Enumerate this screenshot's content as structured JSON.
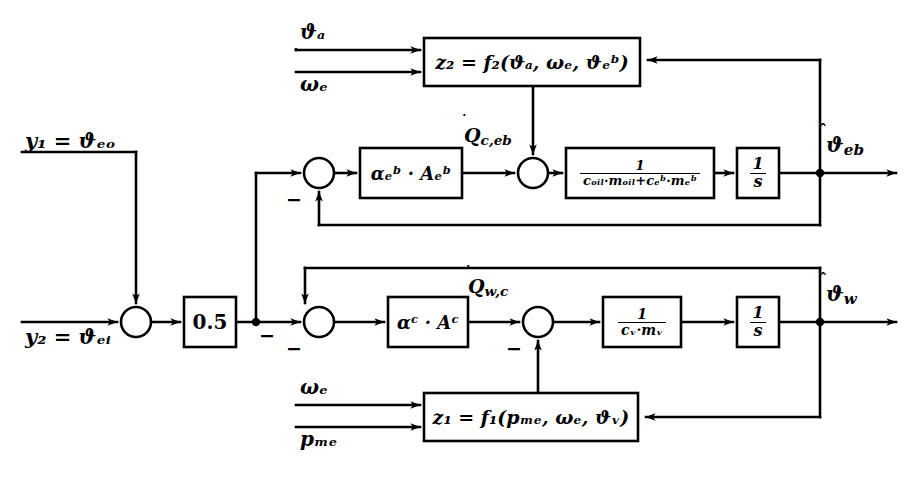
{
  "diagram": {
    "background": "#ffffff",
    "line_color": "#000000"
  },
  "inputs": [
    {
      "id": "theta-a",
      "label": "ϑₐ",
      "base": "ϑ",
      "sub": "a",
      "x": 300,
      "y": 30
    },
    {
      "id": "omega-e-top",
      "label": "ωₑ",
      "base": "ω",
      "sub": "e",
      "x": 300,
      "y": 82
    },
    {
      "id": "y1",
      "label": "y₁ = ϑₑₒ",
      "base": "y",
      "sub": "1",
      "rhs": "ϑ",
      "rhs_sub": "eo",
      "x": 25,
      "y": 140
    },
    {
      "id": "y2",
      "label": "y₂ = ϑₑᵢ",
      "base": "y",
      "sub": "2",
      "rhs": "ϑ",
      "rhs_sub": "ei",
      "x": 25,
      "y": 332
    },
    {
      "id": "omega-e-bottom",
      "label": "ωₑ",
      "base": "ω",
      "sub": "e",
      "x": 300,
      "y": 385
    },
    {
      "id": "p-me",
      "label": "pₘₑ",
      "base": "p",
      "sub": "me",
      "x": 300,
      "y": 438
    }
  ],
  "outputs": [
    {
      "id": "theta-eb-hat",
      "base": "ϑ",
      "sub": "eb",
      "label": "ϑ̂ eb",
      "x": 828,
      "y": 128
    },
    {
      "id": "theta-w-hat",
      "base": "ϑ",
      "sub": "w",
      "label": "ϑ̂ w",
      "x": 828,
      "y": 283
    }
  ],
  "blocks": [
    {
      "id": "f2-block",
      "name": "z2-function-block",
      "kind": "function",
      "text": "z₂ = f₂(ϑₐ, ωₑ, ϑₑᵇ)",
      "lhs": "z",
      "lhs_sub": "2",
      "fn": "f",
      "fn_sub": "2",
      "args": [
        "ϑ a",
        "ω e",
        "ϑ eb"
      ],
      "x": 424,
      "y": 38,
      "w": 216,
      "h": 48,
      "font": 19
    },
    {
      "id": "alpha-eb-block",
      "name": "alpha-eb-gain-block",
      "kind": "gain",
      "text": "αₑᵇ · Aₑᵇ",
      "x": 360,
      "y": 148,
      "w": 102,
      "h": 50,
      "font": 18
    },
    {
      "id": "oil-mass-block",
      "name": "oil-thermal-capacity-block",
      "kind": "fraction",
      "numerator": "1",
      "denominator": "cₒᵢₗ·mₒᵢₗ+cₑᵇ·mₑᵇ",
      "x": 566,
      "y": 148,
      "w": 148,
      "h": 50,
      "font": 13
    },
    {
      "id": "integrator-eb",
      "name": "integrator-block-upper",
      "kind": "fraction",
      "numerator": "1",
      "denominator": "s",
      "x": 737,
      "y": 148,
      "w": 42,
      "h": 50,
      "font": 16
    },
    {
      "id": "half-gain-block",
      "name": "half-gain-block",
      "kind": "gain",
      "text": "0.5",
      "x": 184,
      "y": 297,
      "w": 52,
      "h": 50,
      "font": 20
    },
    {
      "id": "alpha-c-block",
      "name": "alpha-c-gain-block",
      "kind": "gain",
      "text": "αᶜ · Aᶜ",
      "x": 388,
      "y": 297,
      "w": 80,
      "h": 50,
      "font": 18
    },
    {
      "id": "water-mass-block",
      "name": "water-thermal-capacity-block",
      "kind": "fraction",
      "numerator": "1",
      "denominator": "cᵥ·mᵥ",
      "x": 603,
      "y": 297,
      "w": 78,
      "h": 50,
      "font": 14
    },
    {
      "id": "integrator-w",
      "name": "integrator-block-lower",
      "kind": "fraction",
      "numerator": "1",
      "denominator": "s",
      "x": 737,
      "y": 297,
      "w": 42,
      "h": 50,
      "font": 16
    },
    {
      "id": "f1-block",
      "name": "z1-function-block",
      "kind": "function",
      "text": "z₁ = f₁(pₘₑ, ωₑ, ϑᵥ)",
      "lhs": "z",
      "lhs_sub": "1",
      "fn": "f",
      "fn_sub": "1",
      "args": [
        "p me",
        "ω e",
        "ϑ w"
      ],
      "x": 424,
      "y": 393,
      "w": 214,
      "h": 48,
      "font": 19
    }
  ],
  "summers": [
    {
      "id": "sum-input",
      "name": "input-summing-junction",
      "cx": 136,
      "cy": 322,
      "r": 15,
      "signs": []
    },
    {
      "id": "sum-eb-error",
      "name": "eb-error-summing-junction",
      "cx": 319,
      "cy": 173,
      "r": 15,
      "signs": [
        {
          "symbol": "−",
          "x": 286,
          "y": 197
        }
      ]
    },
    {
      "id": "sum-eb-heat",
      "name": "eb-heat-summing-junction",
      "cx": 533,
      "cy": 173,
      "r": 15,
      "signs": []
    },
    {
      "id": "sum-w-error",
      "name": "w-error-summing-junction",
      "cx": 319,
      "cy": 322,
      "r": 15,
      "signs": [
        {
          "symbol": "−",
          "x": 286,
          "y": 346
        }
      ]
    },
    {
      "id": "sum-w-heat",
      "name": "w-heat-summing-junction",
      "cx": 538,
      "cy": 322,
      "r": 15,
      "signs": [
        {
          "symbol": "−",
          "x": 506,
          "y": 346
        }
      ]
    }
  ],
  "signal_labels": [
    {
      "id": "qdot-c-eb",
      "name": "heat-flow-label-eb",
      "base": "Q",
      "sub": "c,eb",
      "dot": true,
      "x": 466,
      "y": 130
    },
    {
      "id": "qdot-w-c",
      "name": "heat-flow-label-wc",
      "base": "Q",
      "sub": "w,c",
      "dot": true,
      "x": 470,
      "y": 281
    },
    {
      "id": "minus-half-branch",
      "name": "minus-sign-half-branch",
      "symbol": "−",
      "x": 286,
      "y": 330
    }
  ],
  "junction_dots": [
    {
      "id": "dot-half-out",
      "name": "half-output-junction-dot",
      "x": 256,
      "y": 322
    },
    {
      "id": "dot-theta-eb",
      "name": "theta-eb-junction-dot",
      "x": 820,
      "y": 173
    },
    {
      "id": "dot-theta-w",
      "name": "theta-w-junction-dot",
      "x": 820,
      "y": 322
    }
  ]
}
